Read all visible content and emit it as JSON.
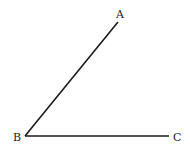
{
  "diagram": {
    "type": "angle",
    "stroke_color": "#1a1a1a",
    "label_color": "#222222",
    "points": {
      "A": {
        "label": "A",
        "x": 118,
        "y": 22
      },
      "B": {
        "label": "B",
        "x": 25,
        "y": 136
      },
      "C": {
        "label": "C",
        "x": 169,
        "y": 136
      }
    },
    "segments": [
      {
        "from": "B",
        "to": "A"
      },
      {
        "from": "B",
        "to": "C"
      }
    ]
  }
}
